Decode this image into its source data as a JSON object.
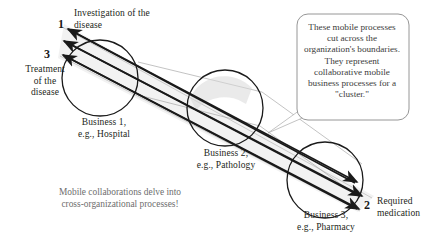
{
  "figure": {
    "title_note": "Mobile collaborations delve into\ncross-organizational processes!",
    "callout": {
      "text": "These mobile processes cut across the organization's boundaries. They represent collaborative mobile business processes for a \"cluster.\""
    },
    "flow_labels": [
      {
        "number": "1",
        "text": "Investigation of the\ndisease"
      },
      {
        "number": "3",
        "text": "Treatment\nof the\ndisease"
      },
      {
        "number": "2",
        "text": "Required\nmedication"
      }
    ],
    "nodes": [
      {
        "id": "business-1",
        "label": "Business 1,\ne.g., Hospital",
        "cx": 100,
        "cy": 78,
        "r": 38
      },
      {
        "id": "business-2",
        "label": "Business 2,\ne.g., Pathology",
        "cx": 225,
        "cy": 108,
        "r": 38
      },
      {
        "id": "business-3",
        "label": "Business 3,\ne.g., Pharmacy",
        "cx": 325,
        "cy": 180,
        "r": 38
      }
    ],
    "colors": {
      "stroke": "#1a1a1a",
      "text": "#231f20",
      "muted_text": "#6e6e6e",
      "callout_text": "#3b3b3b",
      "callout_border": "#8a8a8a",
      "tube_fill": "#f0f0f0",
      "background": "#ffffff"
    }
  }
}
